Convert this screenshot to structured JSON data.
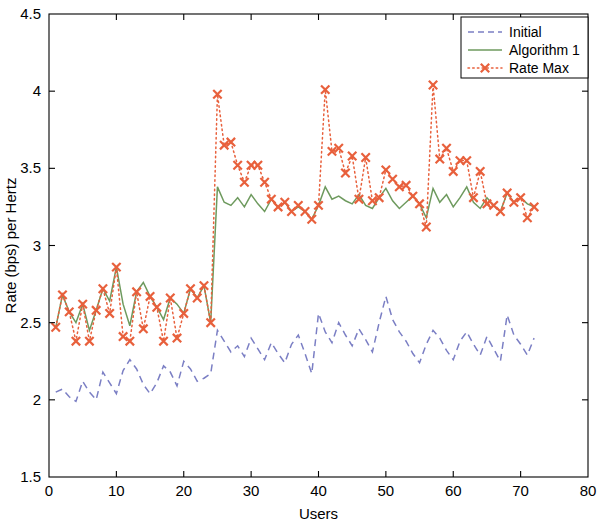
{
  "chart_data": {
    "type": "line",
    "title": "",
    "xlabel": "Users",
    "ylabel": "Rate (bps) per Hertz",
    "xlim": [
      0,
      80
    ],
    "ylim": [
      1.5,
      4.5
    ],
    "xticks": [
      0,
      10,
      20,
      30,
      40,
      50,
      60,
      70,
      80
    ],
    "yticks": [
      1.5,
      2,
      2.5,
      3,
      3.5,
      4,
      4.5
    ],
    "xtick_labels": [
      "0",
      "10",
      "20",
      "30",
      "40",
      "50",
      "60",
      "70",
      "80"
    ],
    "ytick_labels": [
      "1.5",
      "2",
      "2.5",
      "3",
      "3.5",
      "4",
      "4.5"
    ],
    "grid": false,
    "legend_position": "top-right",
    "colors": {
      "initial": "#7B7FC4",
      "algorithm1": "#6E9A5E",
      "rate_max": "#E8603C",
      "axis": "#000000",
      "background": "#FFFFFF"
    },
    "series": [
      {
        "name": "Initial",
        "style": "dashed",
        "marker": "none",
        "color": "#7B7FC4",
        "x": [
          1,
          2,
          3,
          4,
          5,
          6,
          7,
          8,
          9,
          10,
          11,
          12,
          13,
          14,
          15,
          16,
          17,
          18,
          19,
          20,
          21,
          22,
          23,
          24,
          25,
          26,
          27,
          28,
          29,
          30,
          31,
          32,
          33,
          34,
          35,
          36,
          37,
          38,
          39,
          40,
          41,
          42,
          43,
          44,
          45,
          46,
          47,
          48,
          49,
          50,
          51,
          52,
          53,
          54,
          55,
          56,
          57,
          58,
          59,
          60,
          61,
          62,
          63,
          64,
          65,
          66,
          67,
          68,
          69,
          70,
          71,
          72
        ],
        "values": [
          2.05,
          2.07,
          2.02,
          1.99,
          2.12,
          2.05,
          2.0,
          2.18,
          2.11,
          2.04,
          2.19,
          2.26,
          2.2,
          2.1,
          2.04,
          2.11,
          2.22,
          2.18,
          2.09,
          2.25,
          2.2,
          2.12,
          2.14,
          2.17,
          2.45,
          2.38,
          2.31,
          2.35,
          2.28,
          2.4,
          2.33,
          2.26,
          2.37,
          2.3,
          2.24,
          2.36,
          2.42,
          2.3,
          2.17,
          2.56,
          2.44,
          2.37,
          2.5,
          2.42,
          2.35,
          2.46,
          2.39,
          2.31,
          2.5,
          2.67,
          2.52,
          2.44,
          2.38,
          2.3,
          2.24,
          2.36,
          2.45,
          2.4,
          2.32,
          2.26,
          2.38,
          2.44,
          2.36,
          2.29,
          2.41,
          2.33,
          2.25,
          2.55,
          2.42,
          2.36,
          2.29,
          2.4
        ]
      },
      {
        "name": "Algorithm 1",
        "style": "solid",
        "marker": "none",
        "color": "#6E9A5E",
        "x": [
          1,
          2,
          3,
          4,
          5,
          6,
          7,
          8,
          9,
          10,
          11,
          12,
          13,
          14,
          15,
          16,
          17,
          18,
          19,
          20,
          21,
          22,
          23,
          24,
          25,
          26,
          27,
          28,
          29,
          30,
          31,
          32,
          33,
          34,
          35,
          36,
          37,
          38,
          39,
          40,
          41,
          42,
          43,
          44,
          45,
          46,
          47,
          48,
          49,
          50,
          51,
          52,
          53,
          54,
          55,
          56,
          57,
          58,
          59,
          60,
          61,
          62,
          63,
          64,
          65,
          66,
          67,
          68,
          69,
          70,
          71,
          72
        ],
        "values": [
          2.47,
          2.68,
          2.57,
          2.5,
          2.62,
          2.45,
          2.58,
          2.72,
          2.64,
          2.86,
          2.62,
          2.48,
          2.7,
          2.76,
          2.67,
          2.6,
          2.52,
          2.66,
          2.62,
          2.56,
          2.72,
          2.66,
          2.74,
          2.5,
          3.38,
          3.28,
          3.26,
          3.31,
          3.25,
          3.33,
          3.27,
          3.22,
          3.3,
          3.25,
          3.28,
          3.22,
          3.25,
          3.22,
          3.17,
          3.26,
          3.38,
          3.3,
          3.32,
          3.29,
          3.27,
          3.33,
          3.26,
          3.24,
          3.31,
          3.37,
          3.29,
          3.24,
          3.28,
          3.32,
          3.27,
          3.18,
          3.37,
          3.28,
          3.33,
          3.25,
          3.31,
          3.38,
          3.28,
          3.24,
          3.31,
          3.26,
          3.22,
          3.34,
          3.28,
          3.31,
          3.27,
          3.25
        ]
      },
      {
        "name": "Rate Max",
        "style": "dotted",
        "marker": "x",
        "color": "#E8603C",
        "x": [
          1,
          2,
          3,
          4,
          5,
          6,
          7,
          8,
          9,
          10,
          11,
          12,
          13,
          14,
          15,
          16,
          17,
          18,
          19,
          20,
          21,
          22,
          23,
          24,
          25,
          26,
          27,
          28,
          29,
          30,
          31,
          32,
          33,
          34,
          35,
          36,
          37,
          38,
          39,
          40,
          41,
          42,
          43,
          44,
          45,
          46,
          47,
          48,
          49,
          50,
          51,
          52,
          53,
          54,
          55,
          56,
          57,
          58,
          59,
          60,
          61,
          62,
          63,
          64,
          65,
          66,
          67,
          68,
          69,
          70,
          71,
          72
        ],
        "values": [
          2.47,
          2.68,
          2.57,
          2.38,
          2.62,
          2.38,
          2.58,
          2.72,
          2.56,
          2.86,
          2.41,
          2.38,
          2.7,
          2.46,
          2.67,
          2.6,
          2.38,
          2.66,
          2.4,
          2.56,
          2.72,
          2.66,
          2.74,
          2.5,
          3.98,
          3.65,
          3.67,
          3.52,
          3.41,
          3.52,
          3.52,
          3.41,
          3.3,
          3.25,
          3.28,
          3.22,
          3.26,
          3.22,
          3.17,
          3.26,
          4.01,
          3.61,
          3.63,
          3.47,
          3.58,
          3.3,
          3.57,
          3.29,
          3.31,
          3.49,
          3.43,
          3.38,
          3.39,
          3.32,
          3.27,
          3.12,
          4.04,
          3.56,
          3.63,
          3.48,
          3.55,
          3.55,
          3.31,
          3.48,
          3.27,
          3.26,
          3.22,
          3.34,
          3.28,
          3.31,
          3.18,
          3.25
        ]
      }
    ]
  },
  "legend": {
    "entries": [
      {
        "label": "Initial",
        "series": "initial"
      },
      {
        "label": "Algorithm 1",
        "series": "algorithm1"
      },
      {
        "label": "Rate Max",
        "series": "rate_max"
      }
    ]
  }
}
